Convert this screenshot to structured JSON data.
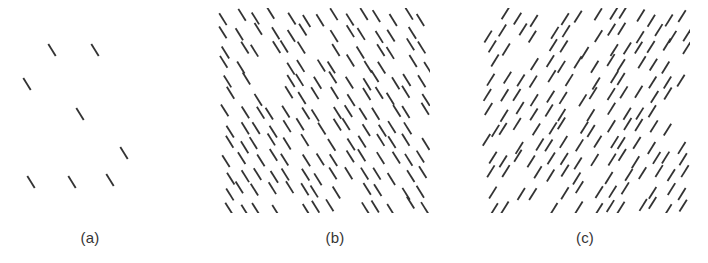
{
  "figure": {
    "name": "line-segment-texture-figure",
    "width": 708,
    "height": 263,
    "background_color": "#ffffff",
    "segment_color": "#333333",
    "segment_length_px": 14,
    "segment_thickness_px": 1.8,
    "panel_count": 3
  },
  "panels": [
    {
      "id": "a",
      "label": "(a)",
      "name": "panel-a-sparse-left-tilt",
      "orientation": "backslash",
      "orientation_degrees": -58,
      "density": "sparse",
      "segment_count": 8,
      "box": {
        "x": 10,
        "y": 30,
        "width": 160,
        "height": 182
      },
      "label_box": {
        "x": 40,
        "y": 229,
        "width": 100,
        "height": 20
      },
      "segments": [
        {
          "cx": 52,
          "cy": 50
        },
        {
          "cx": 95,
          "cy": 50
        },
        {
          "cx": 27,
          "cy": 84
        },
        {
          "cx": 80,
          "cy": 114
        },
        {
          "cx": 124,
          "cy": 153
        },
        {
          "cx": 31,
          "cy": 182
        },
        {
          "cx": 72,
          "cy": 182
        },
        {
          "cx": 110,
          "cy": 180
        }
      ]
    },
    {
      "id": "b",
      "label": "(b)",
      "name": "panel-b-dense-left-tilt",
      "orientation": "backslash",
      "orientation_degrees": -58,
      "density": "dense",
      "segment_count": 166,
      "box": {
        "x": 218,
        "y": 8,
        "width": 212,
        "height": 205
      },
      "label_box": {
        "x": 285,
        "y": 229,
        "width": 100,
        "height": 20
      },
      "grid": {
        "cols": 14,
        "rows": 13,
        "cell_w": 15.2,
        "cell_h": 15.8,
        "jitter": 4.4,
        "fill_probability": 0.74
      },
      "seed": 20947
    },
    {
      "id": "c",
      "label": "(c)",
      "name": "panel-c-dense-right-tilt",
      "orientation": "forwardslash",
      "orientation_degrees": 58,
      "density": "dense",
      "segment_count": 158,
      "box": {
        "x": 482,
        "y": 8,
        "width": 208,
        "height": 205
      },
      "label_box": {
        "x": 535,
        "y": 229,
        "width": 100,
        "height": 20
      },
      "grid": {
        "cols": 14,
        "rows": 13,
        "cell_w": 14.9,
        "cell_h": 15.8,
        "jitter": 4.6,
        "fill_probability": 0.7
      },
      "seed": 71533
    }
  ]
}
